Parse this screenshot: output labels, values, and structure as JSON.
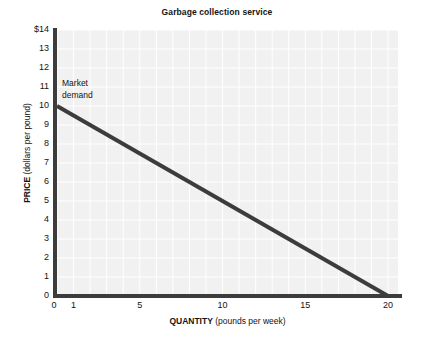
{
  "chart_data": {
    "type": "line",
    "title": "Garbage collection service",
    "xlabel_bold": "QUANTITY",
    "xlabel_rest": "(pounds per week)",
    "ylabel_bold": "PRICE",
    "ylabel_rest": "(dollars per pound)",
    "xlim": [
      0,
      20.6
    ],
    "ylim": [
      0,
      14
    ],
    "grid": true,
    "grid_color": "#ffffff",
    "plot_bg": "#f1f1f1",
    "xticks": [
      0,
      1,
      5,
      10,
      15,
      20
    ],
    "xticklabels": [
      "0",
      "1",
      "5",
      "10",
      "15",
      "20"
    ],
    "yticks": [
      0,
      1,
      2,
      3,
      4,
      5,
      6,
      7,
      8,
      9,
      10,
      11,
      12,
      13,
      14
    ],
    "yticklabels": [
      "0",
      "1",
      "2",
      "3",
      "4",
      "5",
      "6",
      "7",
      "8",
      "9",
      "10",
      "11",
      "12",
      "13",
      "$14"
    ],
    "x_gridline_step": 1,
    "y_gridline_step": 1,
    "legend": "none",
    "series": [
      {
        "name": "Market demand",
        "color": "#3c3c3c",
        "linewidth": 4,
        "x": [
          0,
          20
        ],
        "y": [
          10,
          0
        ],
        "annotation_line1": "Market",
        "annotation_line2": "demand"
      }
    ]
  }
}
